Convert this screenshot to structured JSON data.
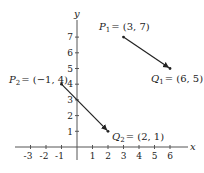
{
  "diagram": {
    "axes": {
      "x_label": "x",
      "y_label": "y",
      "x_ticks": [
        "-3",
        "-2",
        "-1",
        "1",
        "2",
        "3",
        "4",
        "5",
        "6"
      ],
      "y_ticks": [
        "1",
        "2",
        "3",
        "4",
        "5",
        "6",
        "7"
      ]
    },
    "points": {
      "P1": {
        "name": "P",
        "sub": "1",
        "coords": "= (3, 7)"
      },
      "Q1": {
        "name": "Q",
        "sub": "1",
        "coords": "= (6, 5)"
      },
      "P2": {
        "name": "P",
        "sub": "2",
        "coords": "= (−1, 4)"
      },
      "Q2": {
        "name": "Q",
        "sub": "2",
        "coords": "= (2, 1)"
      }
    },
    "segments": [
      {
        "from": "P1 (3, 7)",
        "to": "Q1 (6, 5)",
        "arrow": true
      },
      {
        "from": "P2 (-1, 4)",
        "to": "Q2 (2, 1)",
        "arrow": true
      }
    ]
  }
}
